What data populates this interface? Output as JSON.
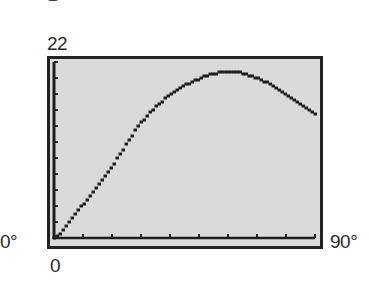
{
  "labels": {
    "y_max": "22",
    "y_min": "0",
    "x_min": "0°",
    "x_max": "90°"
  },
  "colors": {
    "screen_background": "#dadada",
    "frame": "#222222",
    "curve": "#1e1e1e",
    "axis": "#1e1e1e"
  },
  "chart_data": {
    "type": "line",
    "title": "",
    "xlabel": "",
    "ylabel": "",
    "xlim": [
      0,
      90
    ],
    "ylim": [
      0,
      22
    ],
    "x_tick_step": 10,
    "y_tick_step": 2,
    "x_tick_labels": [
      "0°",
      "90°"
    ],
    "y_tick_labels": [
      "0",
      "22"
    ],
    "grid": false,
    "legend": null,
    "style": "graphing-calculator pixel plot",
    "x": [
      0,
      10,
      20,
      30,
      40,
      50,
      60,
      70,
      80,
      90
    ],
    "series": [
      {
        "name": "curve",
        "values": [
          0,
          4.2,
          9.0,
          14.4,
          17.9,
          19.9,
          20.8,
          20.0,
          18.0,
          15.6
        ]
      }
    ]
  }
}
